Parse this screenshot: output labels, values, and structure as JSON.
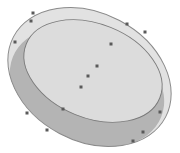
{
  "diagram": {
    "type": "tilted-cylinder-disk",
    "colors": {
      "background": "#ffffff",
      "outer_fill": "#e2e2e2",
      "outer_stroke": "#8a8a8a",
      "side_fill": "#b4b4b4",
      "top_fill": "#dcdcdc",
      "top_stroke": "#7a7a7a",
      "point": "#5a5a5a"
    },
    "outer_ellipse": {
      "cx": 89.5,
      "cy": 77,
      "rx": 86,
      "ry": 64,
      "rotate": 28
    },
    "top_ellipse": {
      "cx": 93,
      "cy": 71,
      "rx": 72,
      "ry": 47,
      "rotate": 22
    },
    "points": [
      {
        "x": 33,
        "y": 13
      },
      {
        "x": 31,
        "y": 21
      },
      {
        "x": 15,
        "y": 42
      },
      {
        "x": 127,
        "y": 24
      },
      {
        "x": 145,
        "y": 32
      },
      {
        "x": 111,
        "y": 44
      },
      {
        "x": 97,
        "y": 66
      },
      {
        "x": 88,
        "y": 76
      },
      {
        "x": 81,
        "y": 87
      },
      {
        "x": 63,
        "y": 109
      },
      {
        "x": 27,
        "y": 113
      },
      {
        "x": 47,
        "y": 130
      },
      {
        "x": 160,
        "y": 112
      },
      {
        "x": 143,
        "y": 132
      },
      {
        "x": 133,
        "y": 141
      }
    ]
  }
}
